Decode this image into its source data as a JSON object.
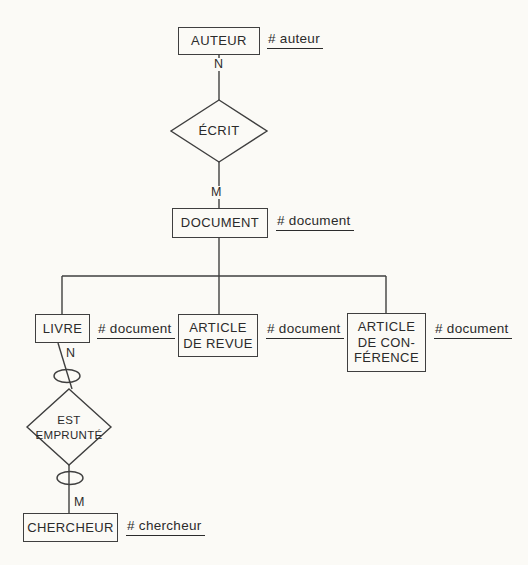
{
  "diagram": {
    "colors": {
      "background": "#fbfaf6",
      "line": "#3f3f3f",
      "text": "#2b2b2b"
    },
    "entities": [
      {
        "id": "auteur",
        "label": "AUTEUR",
        "key": "# auteur"
      },
      {
        "id": "document",
        "label": "DOCUMENT",
        "key": "# document"
      },
      {
        "id": "livre",
        "label": "LIVRE",
        "key": "# document"
      },
      {
        "id": "article-revue",
        "label": "ARTICLE\nDE REVUE",
        "key": "# document"
      },
      {
        "id": "article-conference",
        "label": "ARTICLE\nDE CON-\nFÉRENCE",
        "key": "# document"
      },
      {
        "id": "chercheur",
        "label": "CHERCHEUR",
        "key": "# chercheur"
      }
    ],
    "relations": [
      {
        "id": "ecrit",
        "label": "ÉCRIT",
        "card_top": "N",
        "card_bottom": "M"
      },
      {
        "id": "est-emprunte",
        "label": "EST\nEMPRUNTÉ",
        "card_top": "N",
        "card_bottom": "M"
      }
    ]
  }
}
